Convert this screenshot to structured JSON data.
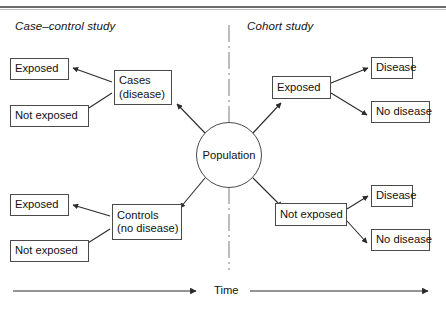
{
  "figure": {
    "kind": "epidemiology-study-design-diagram",
    "width": 446,
    "height": 313
  },
  "titles": {
    "left": "Case–control study",
    "right": "Cohort study"
  },
  "center": {
    "label": "Population"
  },
  "case_control": {
    "cases": {
      "line1": "Cases",
      "line2": "(disease)"
    },
    "cases_outcomes": [
      {
        "label": "Exposed"
      },
      {
        "label": "Not exposed"
      }
    ],
    "controls": {
      "line1": "Controls",
      "line2": "(no disease)"
    },
    "controls_outcomes": [
      {
        "label": "Exposed"
      },
      {
        "label": "Not exposed"
      }
    ]
  },
  "cohort": {
    "exposed": {
      "label": "Exposed"
    },
    "exposed_outcomes": [
      {
        "label": "Disease"
      },
      {
        "label": "No disease"
      }
    ],
    "not_exposed": {
      "label": "Not exposed"
    },
    "not_exposed_outcomes": [
      {
        "label": "Disease"
      },
      {
        "label": "No disease"
      }
    ]
  },
  "axis": {
    "label": "Time"
  },
  "colors": {
    "stroke": "#4a4a4a",
    "text": "#111111",
    "divider": "#9a9a9a",
    "background": "#ffffff"
  }
}
